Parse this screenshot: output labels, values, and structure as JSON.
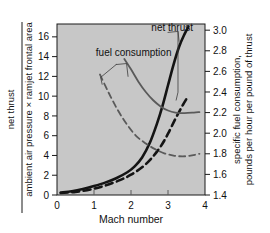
{
  "chart_data": {
    "type": "line",
    "title": "",
    "xlabel": "Mach number",
    "ylabel_left_numerator": "net thrust",
    "ylabel_left_denominator": "ambient air pressure × ramjet frontal area",
    "ylabel_right_line1": "specific fuel consumption,",
    "ylabel_right_line2": "pounds per hour per pound of thrust",
    "xlim": [
      0,
      4
    ],
    "ylim_left": [
      0,
      17.3
    ],
    "ylim_right": [
      1.4,
      3.06
    ],
    "xticks": [
      0,
      1,
      2,
      3,
      4
    ],
    "xticklabels": [
      "0",
      "1",
      "2",
      "3",
      "4"
    ],
    "yticks_left": [
      0,
      2,
      4,
      6,
      8,
      10,
      12,
      14,
      16
    ],
    "yticklabels_left": [
      "0",
      "2",
      "4",
      "6",
      "8",
      "10",
      "12",
      "14",
      "16"
    ],
    "yticks_right": [
      1.4,
      1.6,
      1.8,
      2.0,
      2.2,
      2.4,
      2.6,
      2.8,
      3.0
    ],
    "yticklabels_right": [
      "1.4",
      "1.6",
      "1.8",
      "2.0",
      "2.2",
      "2.4",
      "2.6",
      "2.8",
      "3.0"
    ],
    "grid": false,
    "legend_position": "inline-annotations",
    "plot_background": "#c7c7c7",
    "annotations": [
      {
        "text": "net thrust",
        "x": 2.55,
        "y_left": 16.6
      },
      {
        "text": "fuel consumption",
        "x": 1.05,
        "y_left": 14.1
      }
    ],
    "series": [
      {
        "name": "net thrust (solid)",
        "axis": "left",
        "style": "solid",
        "color": "#141414",
        "width": 2.6,
        "points": [
          [
            0.1,
            0.25
          ],
          [
            0.4,
            0.38
          ],
          [
            0.7,
            0.6
          ],
          [
            1.0,
            0.9
          ],
          [
            1.3,
            1.25
          ],
          [
            1.6,
            1.7
          ],
          [
            1.9,
            2.3
          ],
          [
            2.1,
            2.9
          ],
          [
            2.3,
            3.8
          ],
          [
            2.5,
            5.2
          ],
          [
            2.7,
            7.2
          ],
          [
            2.85,
            9.0
          ],
          [
            3.0,
            11.1
          ],
          [
            3.15,
            13.2
          ],
          [
            3.3,
            15.0
          ],
          [
            3.45,
            16.3
          ],
          [
            3.55,
            17.0
          ]
        ]
      },
      {
        "name": "net thrust (dashed)",
        "axis": "left",
        "style": "dashed",
        "color": "#141414",
        "width": 2.6,
        "points": [
          [
            0.1,
            0.2
          ],
          [
            0.5,
            0.32
          ],
          [
            0.9,
            0.55
          ],
          [
            1.3,
            0.95
          ],
          [
            1.7,
            1.5
          ],
          [
            2.0,
            2.05
          ],
          [
            2.3,
            2.8
          ],
          [
            2.55,
            3.7
          ],
          [
            2.8,
            4.9
          ],
          [
            3.0,
            6.2
          ],
          [
            3.2,
            7.7
          ],
          [
            3.4,
            9.1
          ],
          [
            3.52,
            9.85
          ]
        ]
      },
      {
        "name": "fuel consumption (solid)",
        "axis": "right",
        "style": "solid",
        "color": "#5a5a5a",
        "width": 1.8,
        "points": [
          [
            1.82,
            2.72
          ],
          [
            2.0,
            2.62
          ],
          [
            2.2,
            2.5
          ],
          [
            2.4,
            2.4
          ],
          [
            2.6,
            2.32
          ],
          [
            2.8,
            2.26
          ],
          [
            3.0,
            2.22
          ],
          [
            3.2,
            2.2
          ],
          [
            3.45,
            2.195
          ],
          [
            3.7,
            2.2
          ],
          [
            3.85,
            2.205
          ]
        ]
      },
      {
        "name": "fuel consumption (dashed)",
        "axis": "right",
        "style": "dashed",
        "color": "#5a5a5a",
        "width": 1.8,
        "points": [
          [
            1.16,
            2.57
          ],
          [
            1.4,
            2.39
          ],
          [
            1.65,
            2.22
          ],
          [
            1.9,
            2.08
          ],
          [
            2.15,
            1.97
          ],
          [
            2.4,
            1.9
          ],
          [
            2.65,
            1.845
          ],
          [
            2.9,
            1.805
          ],
          [
            3.15,
            1.783
          ],
          [
            3.4,
            1.775
          ],
          [
            3.65,
            1.785
          ],
          [
            3.85,
            1.8
          ]
        ]
      }
    ],
    "leaders": [
      {
        "name": "net-thrust-leader-solid",
        "path": "M 3.00 16.45 L 3.27 16.55 L 3.30 15.55"
      },
      {
        "name": "net-thrust-leader-dashed",
        "path": "M 3.27 16.55 L 3.27 10.4 L 3.22 9.6"
      },
      {
        "name": "fuel-consumption-leader-solid",
        "path": "M 1.60 13.2 L 1.88 13.3 L 1.92 12.0"
      },
      {
        "name": "fuel-consumption-leader-dashed",
        "path": "M 1.60 13.2 L 1.18 11.9 L 1.22 11.2"
      }
    ]
  }
}
